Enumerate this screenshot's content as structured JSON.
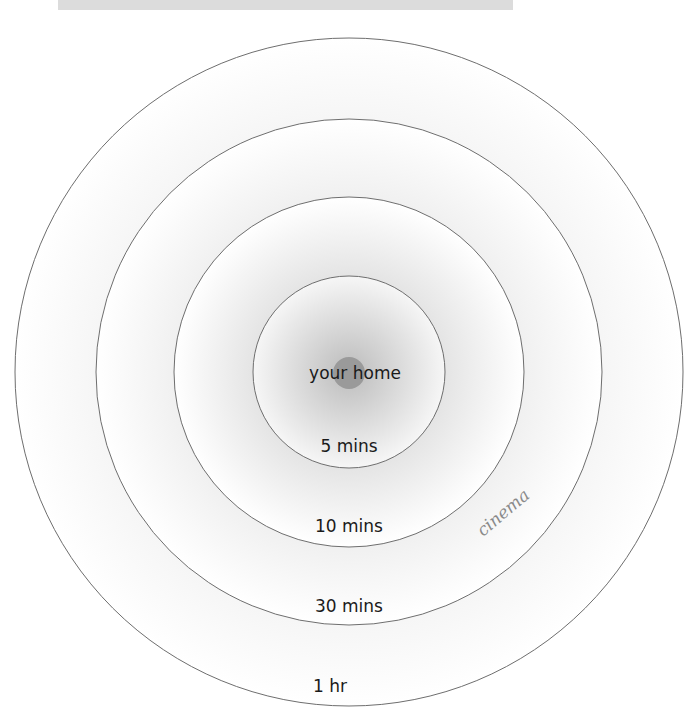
{
  "diagram": {
    "center": {
      "x": 349,
      "y": 372
    },
    "home": {
      "label": "your home",
      "dot_color": "#9a9a9a",
      "dot_radius": 16
    },
    "rings": [
      {
        "label": "1 hr",
        "radius": 334
      },
      {
        "label": "30 mins",
        "radius": 253
      },
      {
        "label": "10 mins",
        "radius": 175
      },
      {
        "label": "5 mins",
        "radius": 96
      }
    ],
    "annotation": {
      "label": "cinema",
      "color": "#8a8a8a"
    },
    "colors": {
      "ring_stroke": "#6e6e6e",
      "gradient_center": "#bdbdbd",
      "gradient_edge": "#ffffff"
    }
  },
  "header_bar": {
    "color": "#dcdcdc"
  }
}
